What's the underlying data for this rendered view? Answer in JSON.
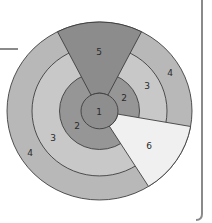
{
  "diagram": {
    "type": "concentric-zone-diagram",
    "colors": {
      "zone1": "#8e8e8e",
      "zone2": "#969696",
      "zone3": "#c8c8c8",
      "zone4": "#b8b8b8",
      "zone5": "#8c8c8c",
      "zone6": "#f0f0f0",
      "stroke": "#3c3c3c",
      "frame": "#8a8a8a"
    },
    "labels": {
      "zone1": "1",
      "zone2_right": "2",
      "zone2_left": "2",
      "zone3_right": "3",
      "zone3_left": "3",
      "zone4_right": "4",
      "zone4_left": "4",
      "zone5": "5",
      "zone6": "6"
    }
  }
}
